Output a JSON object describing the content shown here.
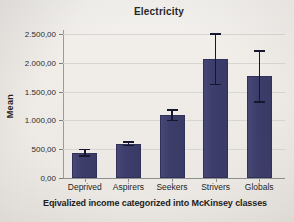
{
  "chart_data": {
    "type": "bar",
    "title": "Electricity",
    "xlabel": "Eqivalized income categorized into McKinsey classes",
    "ylabel": "Mean",
    "categories": [
      "Deprived",
      "Aspirers",
      "Seekers",
      "Strivers",
      "Globals"
    ],
    "values": [
      440,
      595,
      1090,
      2070,
      1770
    ],
    "error_low": [
      370,
      555,
      990,
      1615,
      1310
    ],
    "error_high": [
      510,
      635,
      1190,
      2510,
      2220
    ],
    "ylim": [
      0,
      2500
    ],
    "ytick_values": [
      0,
      500,
      1000,
      1500,
      2000,
      2500
    ],
    "ytick_labels": [
      "0,00",
      "500,00",
      "1.000,00",
      "1.500,00",
      "2.000,00",
      "2.500,00"
    ],
    "grid": true,
    "legend": "none",
    "bar_color": "#3d3d6b",
    "error_color": "#16162e",
    "grid_color": "#d8d6d2",
    "background_color": "#efece8"
  }
}
